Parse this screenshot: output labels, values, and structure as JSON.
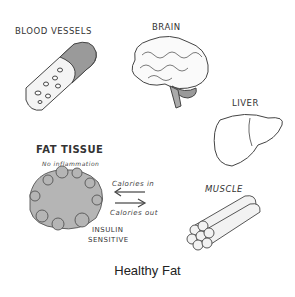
{
  "diagram": {
    "caption": "Healthy Fat",
    "organs": {
      "blood_vessels": {
        "label": "BLOOD VESSELS"
      },
      "brain": {
        "label": "BRAIN"
      },
      "liver": {
        "label": "LIVER"
      },
      "muscle": {
        "label": "MUSCLE"
      },
      "fat_tissue": {
        "label": "FAT TISSUE",
        "sublabel": "No inflammation",
        "status": [
          "INSULIN",
          "SENSITIVE"
        ]
      }
    },
    "arrows": {
      "in": "Calories in",
      "out": "Calories out"
    },
    "colors": {
      "ink": "#333333",
      "fat_fill": "#b5b5b5",
      "shade": "#999999"
    }
  }
}
